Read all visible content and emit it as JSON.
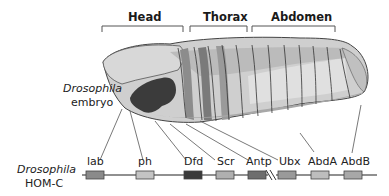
{
  "regions": {
    "head": "Head",
    "thorax": "Thorax",
    "abdomen": "Abdomen"
  },
  "embryo_label": {
    "line1": "Drosophila",
    "line2": "embryo"
  },
  "complex_label": {
    "line1": "Drosophila",
    "line2": "HOM-C"
  },
  "genes": [
    {
      "name": "lab",
      "color": "#8a8a8a"
    },
    {
      "name": "ph",
      "color": "#c4c4c4"
    },
    {
      "name": "Dfd",
      "color": "#3a3a3a"
    },
    {
      "name": "Scr",
      "color": "#b0b0b0"
    },
    {
      "name": "Antp",
      "color": "#6e6e6e"
    },
    {
      "name": "Ubx",
      "color": "#9a9a9a"
    },
    {
      "name": "AbdA",
      "color": "#bdbdbd"
    },
    {
      "name": "AbdB",
      "color": "#a8a8a8"
    }
  ],
  "colors": {
    "line": "#222222",
    "embryo_base": "#c8c8c8",
    "embryo_light": "#dcdcdc"
  }
}
